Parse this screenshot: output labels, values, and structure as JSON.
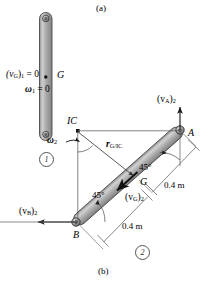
{
  "figure": {
    "panel_a_caption": "(a)",
    "panel_b_caption": "(b)",
    "panel_a": {
      "state_label_velocity": "(v",
      "state_label_velocity_sub": "G",
      "state_label_velocity_tail": ")",
      "state_label_velocity_state": "1",
      "state_label_velocity_eq": " = 0",
      "state_label_omega": "ω",
      "state_label_omega_sub": "1",
      "state_label_omega_eq": " = 0",
      "center_of_mass_label": "G",
      "position_marker": "1",
      "bar_color": "#a8a8a8",
      "bar_edge_color": "#4d4d4d"
    },
    "panel_b": {
      "point_a_label": "A",
      "point_b_label": "B",
      "point_g_label": "G",
      "instant_center_label": "IC",
      "omega_label": "ω",
      "omega_sub": "2",
      "r_vector_label": "r",
      "r_vector_sub": "G/IC",
      "v_a_label": "(v",
      "v_a_sub": "A",
      "v_a_tail": ")",
      "v_a_state": "2",
      "v_b_label": "(v",
      "v_b_sub": "B",
      "v_b_tail": ")",
      "v_b_state": "2",
      "v_g_label": "(v",
      "v_g_sub": "G",
      "v_g_tail": ")",
      "v_g_state": "2",
      "angle_top": "45°",
      "angle_bottom": "45°",
      "dim_upper": "0.4 m",
      "dim_lower": "0.4 m",
      "position_marker": "2",
      "bar_color": "#a8a8a8",
      "bar_edge_color": "#4d4d4d"
    }
  },
  "colors": {
    "stroke": "#2b2b2b",
    "thin": "#555555",
    "bar_fill_light": "#c9c9c9",
    "bar_fill_mid": "#a0a0a0",
    "bar_fill_dark": "#7d7d7d"
  }
}
